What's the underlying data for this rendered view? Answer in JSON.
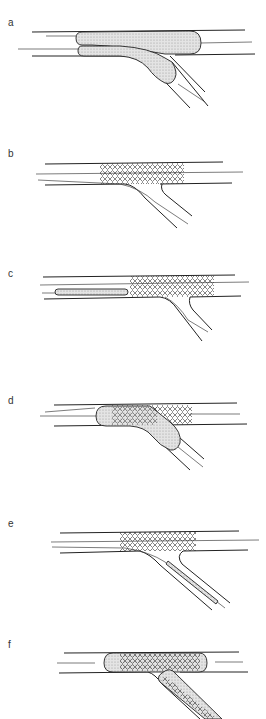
{
  "figure": {
    "panels": [
      {
        "label": "a",
        "content": "kissing balloon pre-dilation in main vessel and side branch"
      },
      {
        "label": "b",
        "content": "stent deployed in main vessel with jailed side-branch wire"
      },
      {
        "label": "c",
        "content": "balloon advanced in main vessel stent; wires in side branch"
      },
      {
        "label": "d",
        "content": "balloon dilation through stent struts into side branch"
      },
      {
        "label": "e",
        "content": "stent delivery into side branch"
      },
      {
        "label": "f",
        "content": "final kissing balloon inflation with stents in both branches"
      }
    ]
  },
  "colors": {
    "line": "#222222",
    "balloon_fill": "#d4d4d4",
    "background": "#ffffff"
  }
}
